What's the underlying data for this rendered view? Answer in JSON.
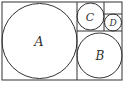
{
  "diagram": {
    "type": "circles-in-rectangles",
    "stroke_color": "#333333",
    "background": "#ffffff",
    "labels": {
      "A": "A",
      "B": "B",
      "C": "C",
      "D": "D"
    }
  }
}
